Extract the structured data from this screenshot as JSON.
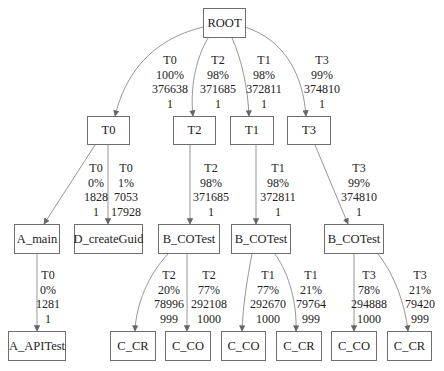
{
  "diagram": {
    "type": "call-tree",
    "nodes": [
      {
        "id": "root",
        "label": "ROOT",
        "x": 203,
        "y": 8,
        "w": 43,
        "h": 30
      },
      {
        "id": "t0",
        "label": "T0",
        "x": 87,
        "y": 116,
        "w": 43,
        "h": 29
      },
      {
        "id": "t2",
        "label": "T2",
        "x": 173,
        "y": 116,
        "w": 43,
        "h": 29
      },
      {
        "id": "t1",
        "label": "T1",
        "x": 230,
        "y": 116,
        "w": 44,
        "h": 29
      },
      {
        "id": "t3",
        "label": "T3",
        "x": 287,
        "y": 116,
        "w": 44,
        "h": 29
      },
      {
        "id": "a_main",
        "label": "A_main",
        "x": 14,
        "y": 224,
        "w": 46,
        "h": 30
      },
      {
        "id": "d_createguid",
        "label": "D_createGuid",
        "x": 74,
        "y": 224,
        "w": 69,
        "h": 30
      },
      {
        "id": "b_cotest_t2",
        "label": "B_COTest",
        "x": 158,
        "y": 224,
        "w": 62,
        "h": 30
      },
      {
        "id": "b_cotest_t1",
        "label": "B_COTest",
        "x": 231,
        "y": 224,
        "w": 60,
        "h": 30
      },
      {
        "id": "b_cotest_t3",
        "label": "B_COTest",
        "x": 324,
        "y": 224,
        "w": 60,
        "h": 30
      },
      {
        "id": "a_apitest",
        "label": "A_APITest",
        "x": 8,
        "y": 331,
        "w": 58,
        "h": 30
      },
      {
        "id": "c_cr_t2",
        "label": "C_CR",
        "x": 110,
        "y": 331,
        "w": 46,
        "h": 30
      },
      {
        "id": "c_co_t2",
        "label": "C_CO",
        "x": 165,
        "y": 331,
        "w": 46,
        "h": 30
      },
      {
        "id": "c_co_t1",
        "label": "C_CO",
        "x": 221,
        "y": 331,
        "w": 45,
        "h": 30
      },
      {
        "id": "c_cr_t1",
        "label": "C_CR",
        "x": 276,
        "y": 331,
        "w": 46,
        "h": 30
      },
      {
        "id": "c_co_t3",
        "label": "C_CO",
        "x": 331,
        "y": 331,
        "w": 46,
        "h": 30
      },
      {
        "id": "c_cr_t3",
        "label": "C_CR",
        "x": 387,
        "y": 331,
        "w": 45,
        "h": 30
      }
    ],
    "edges": [
      {
        "from": "root",
        "to": "t0",
        "lines": [
          "T0",
          "100%",
          "376638",
          "1"
        ],
        "lx": 170,
        "ly": 53,
        "path": "M203,27 C150,40 125,75 115,116"
      },
      {
        "from": "root",
        "to": "t2",
        "lines": [
          "T2",
          "98%",
          "371685",
          "1"
        ],
        "lx": 218,
        "ly": 53,
        "path": "M208,38 C195,60 190,90 193,116"
      },
      {
        "from": "root",
        "to": "t1",
        "lines": [
          "T1",
          "98%",
          "372811",
          "1"
        ],
        "lx": 264,
        "ly": 53,
        "path": "M232,38 C242,60 248,90 249,116"
      },
      {
        "from": "root",
        "to": "t3",
        "lines": [
          "T3",
          "99%",
          "374810",
          "1"
        ],
        "lx": 322,
        "ly": 53,
        "path": "M245,27 C285,40 303,75 306,116"
      },
      {
        "from": "t0",
        "to": "a_main",
        "lines": [
          "T0",
          "0%",
          "1828",
          "1"
        ],
        "lx": 96,
        "ly": 161,
        "path": "M95,145 L44,224"
      },
      {
        "from": "t0",
        "to": "d_createguid",
        "lines": [
          "T0",
          "1%",
          "7053",
          "17928"
        ],
        "lx": 126,
        "ly": 161,
        "path": "M108,145 L108,224"
      },
      {
        "from": "t2",
        "to": "b_cotest_t2",
        "lines": [
          "T2",
          "98%",
          "371685",
          "1"
        ],
        "lx": 211,
        "ly": 161,
        "path": "M190,145 L190,224"
      },
      {
        "from": "t1",
        "to": "b_cotest_t1",
        "lines": [
          "T1",
          "98%",
          "372811",
          "1"
        ],
        "lx": 278,
        "ly": 161,
        "path": "M256,145 L256,224"
      },
      {
        "from": "t3",
        "to": "b_cotest_t3",
        "lines": [
          "T3",
          "99%",
          "374810",
          "1"
        ],
        "lx": 359,
        "ly": 161,
        "path": "M315,145 L348,224"
      },
      {
        "from": "a_main",
        "to": "a_apitest",
        "lines": [
          "T0",
          "0%",
          "1281",
          "1"
        ],
        "lx": 48,
        "ly": 268,
        "path": "M37,254 L37,331"
      },
      {
        "from": "b_cotest_t2",
        "to": "c_cr_t2",
        "lines": [
          "T2",
          "20%",
          "78996",
          "999"
        ],
        "lx": 169,
        "ly": 268,
        "path": "M168,254 C148,275 136,305 135,331"
      },
      {
        "from": "b_cotest_t2",
        "to": "c_co_t2",
        "lines": [
          "T2",
          "77%",
          "292108",
          "1000"
        ],
        "lx": 209,
        "ly": 268,
        "path": "M187,254 L187,331"
      },
      {
        "from": "b_cotest_t1",
        "to": "c_co_t1",
        "lines": [
          "T1",
          "77%",
          "292670",
          "1000"
        ],
        "lx": 268,
        "ly": 268,
        "path": "M252,254 C247,280 243,305 242,331"
      },
      {
        "from": "b_cotest_t1",
        "to": "c_cr_t1",
        "lines": [
          "T1",
          "21%",
          "79764",
          "999"
        ],
        "lx": 311,
        "ly": 268,
        "path": "M275,254 C290,275 297,305 296,331"
      },
      {
        "from": "b_cotest_t3",
        "to": "c_co_t3",
        "lines": [
          "T3",
          "78%",
          "294888",
          "1000"
        ],
        "lx": 369,
        "ly": 268,
        "path": "M354,254 L354,331"
      },
      {
        "from": "b_cotest_t3",
        "to": "c_cr_t3",
        "lines": [
          "T3",
          "21%",
          "79420",
          "999"
        ],
        "lx": 420,
        "ly": 268,
        "path": "M378,254 C395,275 405,305 408,331"
      }
    ]
  }
}
